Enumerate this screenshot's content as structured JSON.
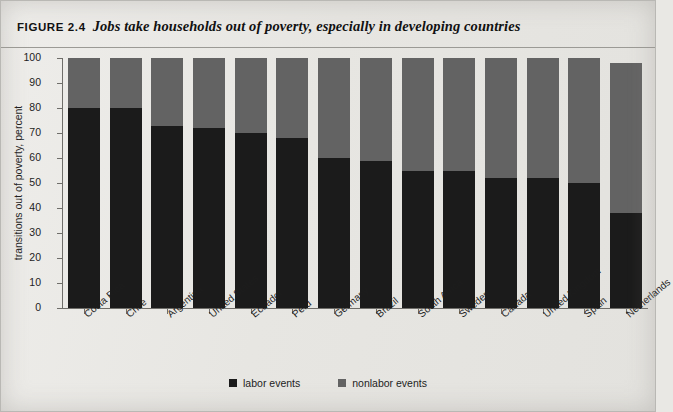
{
  "figure": {
    "number": "FIGURE 2.4",
    "title": "Jobs take households out of poverty, especially in developing countries"
  },
  "chart_data": {
    "type": "bar",
    "subtype": "stacked-vertical-100",
    "title": "Jobs take households out of poverty, especially in developing countries",
    "xlabel": "",
    "ylabel": "transitions out of poverty, percent",
    "ylim": [
      0,
      100
    ],
    "yticks": [
      0,
      10,
      20,
      30,
      40,
      50,
      60,
      70,
      80,
      90,
      100
    ],
    "ytick_labels": [
      "0",
      "10",
      "20",
      "30",
      "40",
      "50",
      "60",
      "70",
      "80",
      "90",
      "100"
    ],
    "grid": false,
    "legend_position": "bottom-center",
    "categories": [
      "Costa Rica",
      "Chile",
      "Argentina",
      "United States",
      "Ecuador",
      "Peru",
      "Germany",
      "Brazil",
      "South Africa",
      "Sweden",
      "Canada",
      "United Kingdom",
      "Spain",
      "Netherlands"
    ],
    "series": [
      {
        "name": "labor events",
        "color": "#1b1b1b",
        "values": [
          80,
          80,
          73,
          72,
          70,
          68,
          60,
          59,
          55,
          55,
          52,
          52,
          50,
          38
        ]
      },
      {
        "name": "nonlabor events",
        "color": "#636363",
        "values": [
          20,
          20,
          27,
          28,
          30,
          32,
          40,
          41,
          45,
          45,
          48,
          48,
          50,
          60
        ]
      }
    ],
    "totals": [
      100,
      100,
      100,
      100,
      100,
      100,
      100,
      100,
      100,
      100,
      100,
      100,
      100,
      98
    ]
  },
  "legend": {
    "items": [
      {
        "label": "labor events",
        "color": "#1b1b1b"
      },
      {
        "label": "nonlabor events",
        "color": "#636363"
      }
    ]
  },
  "colors": {
    "labor": "#1b1b1b",
    "nonlabor": "#636363",
    "background": "#e9e8e4",
    "axis": "#6f6e6a",
    "text": "#1d1d1d"
  }
}
